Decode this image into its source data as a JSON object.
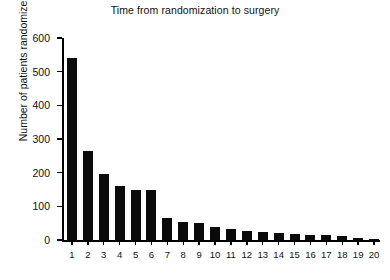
{
  "chart_data": {
    "type": "bar",
    "title": "Time from randomization to surgery",
    "xlabel": "",
    "ylabel": "Number of patients randomized",
    "categories": [
      "1",
      "2",
      "3",
      "4",
      "5",
      "6",
      "7",
      "8",
      "9",
      "10",
      "11",
      "12",
      "13",
      "14",
      "15",
      "16",
      "17",
      "18",
      "19",
      "20"
    ],
    "values": [
      540,
      265,
      196,
      160,
      148,
      148,
      65,
      53,
      50,
      38,
      33,
      27,
      24,
      20,
      18,
      16,
      15,
      12,
      5,
      4
    ],
    "ylim": [
      0,
      600
    ],
    "yticks": [
      0,
      100,
      200,
      300,
      400,
      500,
      600
    ],
    "ytick_labels": [
      "0",
      "100",
      "200",
      "300",
      "400",
      "500",
      "600"
    ],
    "grid": false,
    "legend": false,
    "bar_color": "#0a0a0a",
    "axis_color": "#000000",
    "background": "#ffffff"
  }
}
